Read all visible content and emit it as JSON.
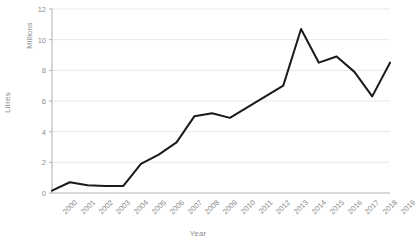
{
  "chart_data": {
    "type": "line",
    "title": "",
    "xlabel": "Year",
    "ylabel": "Litres",
    "unit_label": "Millions",
    "categories": [
      "2000",
      "2001",
      "2002",
      "2003",
      "2004",
      "2005",
      "2006",
      "2007",
      "2008",
      "2009",
      "2010",
      "2011",
      "2012",
      "2013",
      "2014",
      "2015",
      "2016",
      "2017",
      "2018",
      "2019"
    ],
    "values": [
      0.15,
      0.7,
      0.5,
      0.45,
      0.45,
      1.9,
      2.5,
      3.3,
      5.0,
      5.2,
      4.9,
      5.6,
      6.3,
      7.0,
      10.7,
      8.5,
      8.9,
      7.9,
      6.3,
      8.5
    ],
    "ylim": [
      0,
      12
    ],
    "yticks": [
      0,
      2,
      4,
      6,
      8,
      10,
      12
    ],
    "grid": "horizontal",
    "legend": "none",
    "series": [
      {
        "name": "Litres",
        "color": "#1a1a1a",
        "values": [
          0.15,
          0.7,
          0.5,
          0.45,
          0.45,
          1.9,
          2.5,
          3.3,
          5.0,
          5.2,
          4.9,
          5.6,
          6.3,
          7.0,
          10.7,
          8.5,
          8.9,
          7.9,
          6.3,
          8.5
        ]
      }
    ],
    "colors": {
      "line": "#1a1a1a",
      "grid": "#e8e8e8",
      "axis": "#b0b0b0",
      "tick_text": "#8d8d8d",
      "background": "#ffffff"
    }
  }
}
